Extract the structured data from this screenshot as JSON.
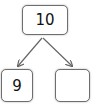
{
  "diagram": {
    "type": "number-bond",
    "whole": {
      "value": "10"
    },
    "parts": [
      {
        "value": "9"
      },
      {
        "value": ""
      }
    ],
    "colors": {
      "stroke": "#6e6e6e",
      "arrow": "#666666",
      "text": "#111111",
      "background": "#ffffff"
    }
  }
}
